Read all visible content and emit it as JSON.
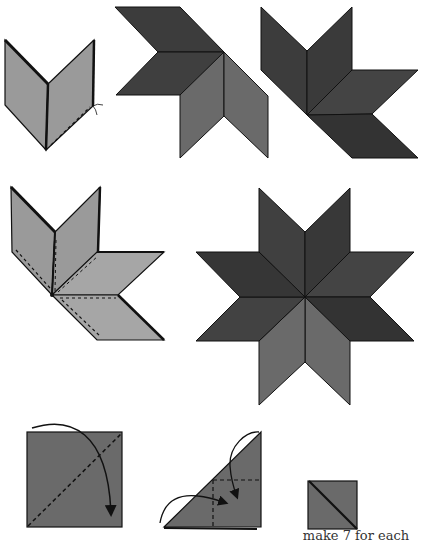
{
  "diagram": {
    "colors": {
      "light_gray": "#9a9a9a",
      "medium_gray": "#6a6a6a",
      "dark_gray": "#3c3c3c",
      "darker_gray": "#333333",
      "outline": "#111111",
      "background": "#ffffff"
    },
    "steps": [
      {
        "id": "step-1",
        "label": "Join two diamonds with seam"
      },
      {
        "id": "step-2",
        "label": "Quarter star of three diamonds"
      },
      {
        "id": "step-3",
        "label": "Quarter star with corner pieces"
      },
      {
        "id": "step-4",
        "label": "Half star of four diamonds, seams dashed"
      },
      {
        "id": "step-5",
        "label": "Completed eight-pointed star"
      },
      {
        "id": "step-6",
        "label": "Square folded on diagonal"
      },
      {
        "id": "step-7",
        "label": "Triangle folded into square"
      },
      {
        "id": "step-8",
        "label": "Finished square with diagonal"
      }
    ],
    "caption": "make 7 for each"
  }
}
